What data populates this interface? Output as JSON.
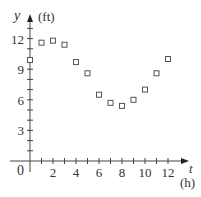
{
  "chart_data": {
    "type": "scatter",
    "title": "",
    "xlabel": "t",
    "xunit": "(h)",
    "ylabel": "y",
    "yunit": "(ft)",
    "x_ticks_labeled": [
      2,
      4,
      6,
      8,
      10,
      12
    ],
    "x_minor_step": 1,
    "y_ticks_labeled": [
      3,
      6,
      9,
      12
    ],
    "y_minor_step": 1,
    "origin_label": "0",
    "xlim": [
      0,
      13
    ],
    "ylim": [
      0,
      13
    ],
    "grid": false,
    "legend": null,
    "marker": "open-square",
    "series": [
      {
        "name": "water depth",
        "x": [
          0,
          1,
          2,
          3,
          4,
          5,
          6,
          7,
          8,
          9,
          10,
          11,
          12
        ],
        "y": [
          9.9,
          11.6,
          11.8,
          11.4,
          9.7,
          8.6,
          6.5,
          5.7,
          5.4,
          6.0,
          7.0,
          8.6,
          10.0
        ]
      }
    ]
  },
  "colors": {
    "axis": "#444444",
    "marker": "#555555",
    "text": "#333333"
  }
}
